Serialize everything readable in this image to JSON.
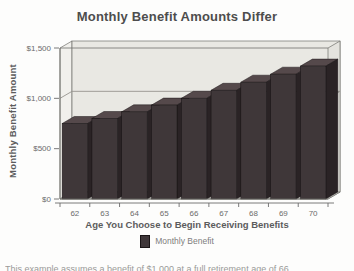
{
  "title": "Monthly Benefit Amounts Differ",
  "chart_data": {
    "type": "bar",
    "title": "Monthly Benefit Amounts Differ",
    "categories": [
      "62",
      "63",
      "64",
      "65",
      "66",
      "67",
      "68",
      "69",
      "70"
    ],
    "series": [
      {
        "name": "Monthly Benefit",
        "values": [
          750,
          800,
          866,
          933,
          1000,
          1080,
          1160,
          1240,
          1320
        ]
      }
    ],
    "xlabel": "Age You Choose to Begin Receiving Benefits",
    "ylabel": "Monthly Benefit Amount",
    "ylim": [
      0,
      1500
    ],
    "yticks": [
      {
        "value": 0,
        "label": "$0"
      },
      {
        "value": 500,
        "label": "$500"
      },
      {
        "value": 1000,
        "label": "$1,000"
      },
      {
        "value": 1500,
        "label": "$1,500"
      }
    ],
    "gridlines": [
      1000
    ],
    "grid": "on",
    "style": "3d",
    "legend_position": "bottom",
    "colors": {
      "bar_front": "#3f3739",
      "bar_top": "#55494b",
      "bar_side": "#2a2325",
      "wall_back": "#e9e8e3",
      "wall_left": "#f1f0ec",
      "wall_right": "#e4e3de",
      "floor": "#dcdbd5",
      "frame": "#70706c",
      "gridline": "#96948e",
      "tick_text": "#6b6b6b"
    }
  },
  "legend": {
    "entries": [
      {
        "label": "Monthly Benefit",
        "color": "#3f3739"
      }
    ]
  },
  "caption": "This example assumes a benefit of $1,000 at a full retirement age of 66."
}
